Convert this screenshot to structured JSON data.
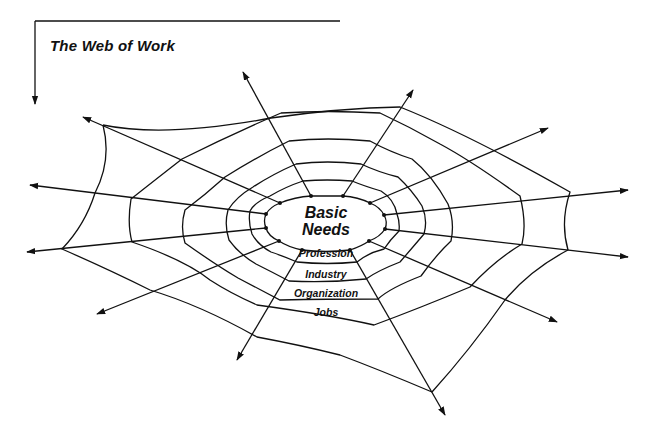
{
  "diagram": {
    "title": "The Web of Work",
    "center": {
      "label_line1": "Basic",
      "label_line2": "Needs"
    },
    "layers": [
      {
        "label": "Profession"
      },
      {
        "label": "Industry"
      },
      {
        "label": "Organization"
      },
      {
        "label": "Jobs"
      }
    ],
    "structure": {
      "type": "spider-web",
      "radial_count": 11,
      "radials_have_arrowheads": true,
      "bracket_arrow": "top-left corner arrow pointing down"
    },
    "colors": {
      "line": "#111111",
      "background": "#ffffff"
    }
  }
}
